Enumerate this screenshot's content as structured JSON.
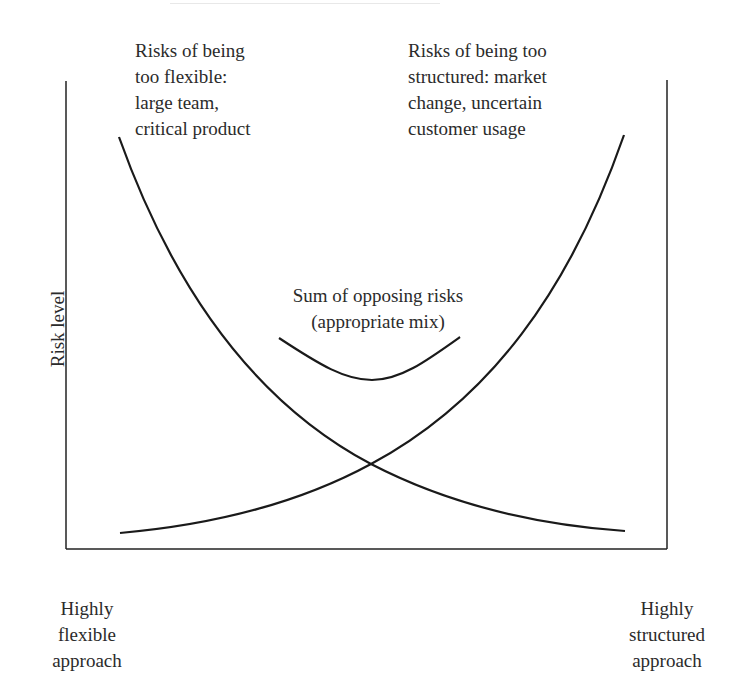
{
  "diagram": {
    "title_visible": false,
    "y_axis_label": "Risk level",
    "labels": {
      "too_flexible": [
        "Risks of being",
        "too flexible:",
        "large team,",
        "critical product"
      ],
      "too_structured": [
        "Risks of being too",
        "structured: market",
        "change, uncertain",
        "customer usage"
      ],
      "sum": [
        "Sum of opposing risks",
        "(appropriate mix)"
      ],
      "x_left": [
        "Highly",
        "flexible",
        "approach"
      ],
      "x_right": [
        "Highly",
        "structured",
        "approach"
      ]
    },
    "curves": [
      {
        "name": "Risk of being too flexible",
        "trend": "decreasing"
      },
      {
        "name": "Risk of being too structured",
        "trend": "increasing"
      },
      {
        "name": "Sum of opposing risks",
        "trend": "U-shaped, minimum at midpoint"
      }
    ],
    "colors": {
      "line": "#1a1a1a",
      "text": "#2b2b2b",
      "background": "#ffffff"
    }
  }
}
